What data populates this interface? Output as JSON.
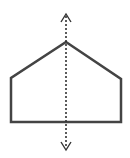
{
  "figure": {
    "description": "Pentagon (house shape) with a vertical dotted line of symmetry",
    "shape": {
      "type": "pentagon",
      "vertices": [
        [
          66,
          42
        ],
        [
          121,
          79
        ],
        [
          121,
          122
        ],
        [
          11,
          122
        ],
        [
          11,
          78
        ]
      ],
      "stroke": "#444444",
      "stroke_width": 2.5,
      "fill": "#ffffff"
    },
    "symmetry_line": {
      "type": "dotted-double-arrow",
      "x": 66,
      "y_start": 14,
      "y_end": 150,
      "stroke": "#333333"
    }
  }
}
